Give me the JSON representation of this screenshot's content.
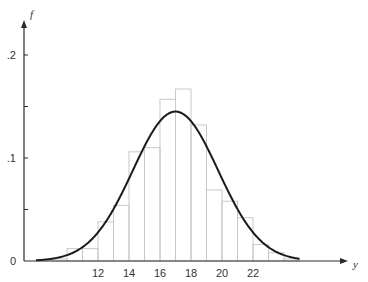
{
  "chart_data": {
    "type": "bar",
    "title": "",
    "xlabel": "y",
    "ylabel": "f",
    "xlim": [
      7.5,
      25
    ],
    "ylim": [
      0,
      0.22
    ],
    "x_ticks": [
      12,
      14,
      16,
      18,
      20,
      22
    ],
    "x_tick_labels": [
      "12",
      "14",
      "16",
      "18",
      "20",
      "22"
    ],
    "y_ticks": [
      0,
      0.05,
      0.1,
      0.15,
      0.2
    ],
    "y_tick_labels": [
      "0",
      "",
      ".1",
      "",
      ".2"
    ],
    "grid": false,
    "histogram": {
      "bin_width": 1,
      "bins": [
        {
          "left": 9,
          "value": 0.002
        },
        {
          "left": 10,
          "value": 0.012
        },
        {
          "left": 11,
          "value": 0.012
        },
        {
          "left": 12,
          "value": 0.038
        },
        {
          "left": 13,
          "value": 0.054
        },
        {
          "left": 14,
          "value": 0.106
        },
        {
          "left": 15,
          "value": 0.11
        },
        {
          "left": 16,
          "value": 0.157
        },
        {
          "left": 17,
          "value": 0.167
        },
        {
          "left": 18,
          "value": 0.132
        },
        {
          "left": 19,
          "value": 0.069
        },
        {
          "left": 20,
          "value": 0.058
        },
        {
          "left": 21,
          "value": 0.042
        },
        {
          "left": 22,
          "value": 0.016
        },
        {
          "left": 23,
          "value": 0.008
        },
        {
          "left": 24,
          "value": 0.002
        }
      ]
    },
    "curve": {
      "type": "normal-density",
      "mean": 17.0,
      "sd": 2.75,
      "x_range": [
        8,
        25
      ]
    }
  }
}
